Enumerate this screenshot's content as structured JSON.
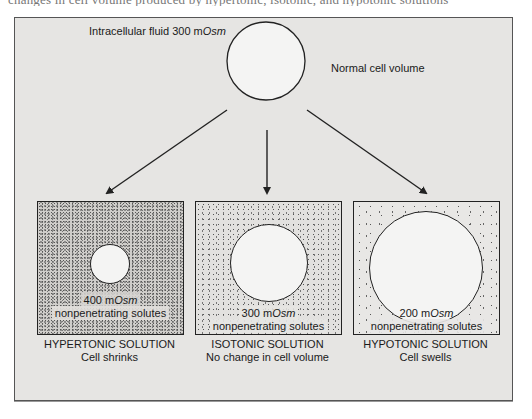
{
  "caption": "changes in cell volume produced by hypertonic, isotonic, and hypotonic solutions",
  "top": {
    "fluid_label_prefix": "Intracellular fluid 300 m",
    "fluid_label_unit": "Osm",
    "normal_label": "Normal cell volume"
  },
  "panels": [
    {
      "id": "hypertonic",
      "concentration_prefix": "400 m",
      "concentration_unit": "Osm",
      "solute_label": "nonpenetrating solutes",
      "title": "HYPERTONIC SOLUTION",
      "subtitle": "Cell shrinks"
    },
    {
      "id": "isotonic",
      "concentration_prefix": "300 m",
      "concentration_unit": "Osm",
      "solute_label": "nonpenetrating solutes",
      "title": "ISOTONIC SOLUTION",
      "subtitle": "No change in cell volume"
    },
    {
      "id": "hypotonic",
      "concentration_prefix": "200 m",
      "concentration_unit": "Osm",
      "solute_label": "nonpenetrating solutes",
      "title": "HYPOTONIC SOLUTION",
      "subtitle": "Cell swells"
    }
  ],
  "colors": {
    "panel_bg": "#e6e5e3",
    "cell_fill": "#f4f4f3",
    "stroke": "#222222"
  }
}
